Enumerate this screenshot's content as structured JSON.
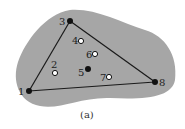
{
  "diagram": {
    "caption": "(a)",
    "colors": {
      "region": "#a6a6a6",
      "edge": "#1a1a1a",
      "filled_point": "#111111",
      "open_point_fill": "#ffffff",
      "open_point_stroke": "#111111"
    },
    "triangle_vertices": [
      "1",
      "3",
      "8"
    ],
    "points": [
      {
        "id": "1",
        "label": "1",
        "type": "filled",
        "x": 29,
        "y": 91
      },
      {
        "id": "2",
        "label": "2",
        "type": "open",
        "x": 55,
        "y": 73
      },
      {
        "id": "3",
        "label": "3",
        "type": "filled",
        "x": 70,
        "y": 21
      },
      {
        "id": "4",
        "label": "4",
        "type": "open",
        "x": 81,
        "y": 41
      },
      {
        "id": "5",
        "label": "5",
        "type": "filled",
        "x": 88,
        "y": 69
      },
      {
        "id": "6",
        "label": "6",
        "type": "open",
        "x": 95,
        "y": 54
      },
      {
        "id": "7",
        "label": "7",
        "type": "open",
        "x": 109,
        "y": 77
      },
      {
        "id": "8",
        "label": "8",
        "type": "filled",
        "x": 155,
        "y": 82
      }
    ]
  }
}
